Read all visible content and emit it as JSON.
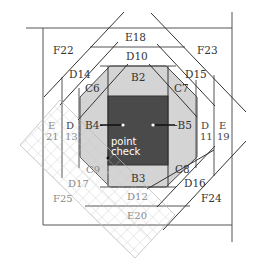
{
  "diagram": {
    "colors": {
      "center_square": "#4a4a4a",
      "octagon_fill": "#d4d4d4",
      "lines": "#555555",
      "grid_overlay": "#cfcfcf",
      "background": "#ffffff"
    },
    "labels": {
      "B2": "B2",
      "B3": "B3",
      "B4": "B4-",
      "B5": "-B5",
      "C6": "C6",
      "C7": "C7",
      "C8": "C8",
      "C9": "C9",
      "D10": "D10",
      "D11_top": "D",
      "D11_bottom": "11",
      "D12": "D12",
      "D13_top": "D",
      "D13_bottom": "13",
      "D14": "D14",
      "D15": "D15",
      "D16": "D16",
      "D17": "D17",
      "E18": "E18",
      "E19_top": "E",
      "E19_bottom": "19",
      "E20": "E20",
      "E21_top": "E",
      "E21_bottom": "21",
      "F22": "F22",
      "F23": "F23",
      "F24": "F24",
      "F25": "F25",
      "point_check_line1": "point",
      "point_check_line2": "check"
    }
  }
}
